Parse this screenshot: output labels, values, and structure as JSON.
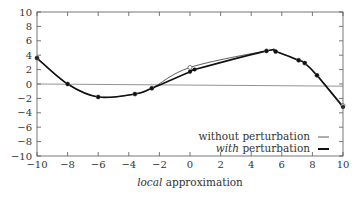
{
  "chart_data": {
    "type": "line",
    "title": "",
    "xlabel_italic": "local",
    "xlabel_rest": " approximation",
    "xlabel": "local approximation",
    "ylabel": "",
    "xlim": [
      -10,
      10
    ],
    "ylim": [
      -10,
      10
    ],
    "xticks": [
      -10,
      -8,
      -6,
      -4,
      -2,
      0,
      2,
      4,
      6,
      8,
      10
    ],
    "yticks": [
      -10,
      -8,
      -6,
      -4,
      -2,
      0,
      2,
      4,
      6,
      8,
      10
    ],
    "grid": false,
    "legend_position": "lower right",
    "series": [
      {
        "name": "without perturbation",
        "style": "thin",
        "points": [
          {
            "x": -10,
            "y": 3.6
          },
          {
            "x": -8,
            "y": 0.0
          },
          {
            "x": -6,
            "y": -1.8
          },
          {
            "x": -3.6,
            "y": -1.4
          },
          {
            "x": -2.5,
            "y": -0.6
          },
          {
            "x": 0,
            "y": 2.3
          },
          {
            "x": 5,
            "y": 4.6
          },
          {
            "x": 5.6,
            "y": 4.5
          },
          {
            "x": 7.1,
            "y": 3.3
          },
          {
            "x": 7.5,
            "y": 2.9
          },
          {
            "x": 8.3,
            "y": 1.2
          },
          {
            "x": 10,
            "y": -3.0
          }
        ]
      },
      {
        "name": "with perturbation",
        "style": "thick",
        "points": [
          {
            "x": -10,
            "y": 3.6
          },
          {
            "x": -8,
            "y": 0.0
          },
          {
            "x": -6,
            "y": -1.8
          },
          {
            "x": -3.6,
            "y": -1.4
          },
          {
            "x": -2.5,
            "y": -0.6
          },
          {
            "x": 0,
            "y": 1.7
          },
          {
            "x": 0.3,
            "y": 2.0
          },
          {
            "x": 5,
            "y": 4.6
          },
          {
            "x": 5.6,
            "y": 4.5
          },
          {
            "x": 7.1,
            "y": 3.3
          },
          {
            "x": 7.5,
            "y": 2.9
          },
          {
            "x": 8.3,
            "y": 1.2
          },
          {
            "x": 10,
            "y": -3.2
          }
        ]
      }
    ],
    "reference_line": {
      "y": 0,
      "from": -10,
      "to": 10,
      "y_end": -0.3
    }
  }
}
